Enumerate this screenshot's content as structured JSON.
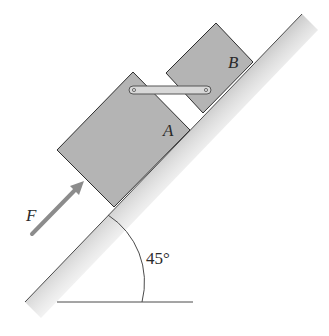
{
  "diagram": {
    "type": "physics-free-body-incline",
    "incline": {
      "angle_label": "45°",
      "surface_color": "#d6d6d6",
      "edge_color": "#4a4a4a"
    },
    "blocks": [
      {
        "id": "A",
        "label": "A",
        "fill": "#b4b4b4",
        "stroke": "#2e2e2e"
      },
      {
        "id": "B",
        "label": "B",
        "fill": "#b4b4b4",
        "stroke": "#2e2e2e"
      }
    ],
    "link": {
      "fill": "#d8d8d8",
      "stroke": "#555555"
    },
    "force": {
      "label": "F",
      "color": "#8c8c8c"
    }
  }
}
